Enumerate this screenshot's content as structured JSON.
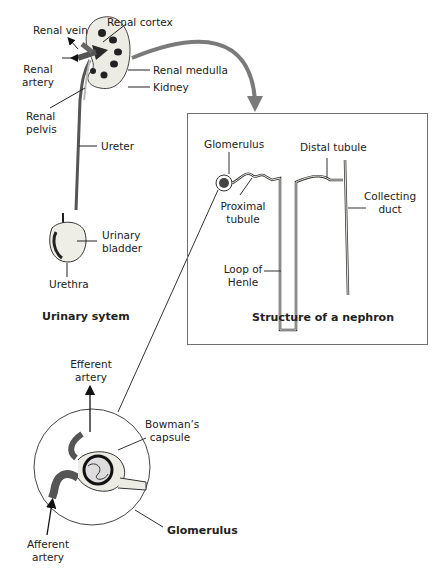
{
  "urinary_system": {
    "title": "Urinary sytem",
    "labels": {
      "renal_vein": "Renal vein",
      "renal_cortex": "Renal cortex",
      "renal_artery_1": "Renal",
      "renal_artery_2": "artery",
      "renal_medulla": "Renal medulla",
      "kidney": "Kidney",
      "renal_pelvis_1": "Renal",
      "renal_pelvis_2": "pelvis",
      "ureter": "Ureter",
      "urinary_bladder_1": "Urinary",
      "urinary_bladder_2": "bladder",
      "urethra": "Urethra"
    }
  },
  "nephron": {
    "title": "Structure of a nephron",
    "labels": {
      "glomerulus": "Glomerulus",
      "distal_tubule": "Distal tubule",
      "collecting_duct_1": "Collecting",
      "collecting_duct_2": "duct",
      "proximal_tubule_1": "Proximal",
      "proximal_tubule_2": "tubule",
      "loop_of_henle_1": "Loop of",
      "loop_of_henle_2": "Henle"
    }
  },
  "glomerulus_detail": {
    "title": "Glomerulus",
    "labels": {
      "efferent_artery_1": "Efferent",
      "efferent_artery_2": "artery",
      "bowmans_capsule_1": "Bowman’s",
      "bowmans_capsule_2": "capsule",
      "afferent_artery_1": "Afferent",
      "afferent_artery_2": "artery"
    }
  },
  "colors": {
    "arrow": "#7a7a7a",
    "outline": "#333333",
    "tissue": "#e8e6df",
    "dark": "#2a2a2a"
  }
}
